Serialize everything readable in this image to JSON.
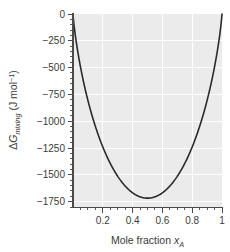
{
  "chart_data": {
    "type": "line",
    "title": "",
    "subtitle": "",
    "xlabel": "Mole fraction x_A",
    "xlabel_parts": {
      "text": "Mole fraction ",
      "symbol": "x",
      "subscript": "A"
    },
    "ylabel": "ΔG_mixing (J mol⁻¹)",
    "ylabel_parts": {
      "delta": "Δ",
      "symbol": "G",
      "subscript": "mixing",
      "units_open": " (J mol",
      "units_exp": "−1",
      "units_close": ")"
    },
    "xlim": [
      0,
      1
    ],
    "ylim": [
      -1800,
      0
    ],
    "xticks": [
      0.2,
      0.4,
      0.6,
      0.8,
      1
    ],
    "xtick_labels": [
      "0.2",
      "0.4",
      "0.6",
      "0.8",
      "1"
    ],
    "xminor_step": 0.05,
    "yticks": [
      0,
      -250,
      -500,
      -750,
      -1000,
      -1250,
      -1500,
      -1750
    ],
    "ytick_labels": [
      "0",
      "−250",
      "−500",
      "−750",
      "−1000",
      "−1250",
      "−1500",
      "−1750"
    ],
    "yminor_step": 50,
    "grid": true,
    "grid_color": "#ffffff",
    "panel_color": "#ebebeb",
    "legend": null,
    "series": [
      {
        "name": "Ideal Gibbs energy of mixing",
        "equation": "ΔG_mix = RT(x_A ln x_A + x_B ln x_B)",
        "RT": 2478,
        "color": "#2b2b2b",
        "x": [
          0.005,
          0.01,
          0.02,
          0.03,
          0.04,
          0.05,
          0.06,
          0.08,
          0.1,
          0.12,
          0.14,
          0.16,
          0.18,
          0.2,
          0.22,
          0.24,
          0.26,
          0.28,
          0.3,
          0.32,
          0.34,
          0.36,
          0.38,
          0.4,
          0.42,
          0.44,
          0.46,
          0.48,
          0.5,
          0.52,
          0.54,
          0.56,
          0.58,
          0.6,
          0.62,
          0.64,
          0.66,
          0.68,
          0.7,
          0.72,
          0.74,
          0.76,
          0.78,
          0.8,
          0.82,
          0.84,
          0.86,
          0.88,
          0.9,
          0.92,
          0.94,
          0.96,
          0.98,
          0.99,
          0.995
        ],
        "y": [
          -78,
          -135,
          -231,
          -315,
          -391,
          -462,
          -528,
          -652,
          -764,
          -867,
          -963,
          -1053,
          -1137,
          -1216,
          -1290,
          -1359,
          -1424,
          -1485,
          -1541,
          -1594,
          -1642,
          -1686,
          -1706,
          -1715,
          -1711,
          -1717,
          -1717,
          -1717,
          -1717,
          -1717,
          -1717,
          -1717,
          -1711,
          -1715,
          -1706,
          -1686,
          -1642,
          -1594,
          -1541,
          -1485,
          -1424,
          -1359,
          -1290,
          -1216,
          -1137,
          -1053,
          -963,
          -867,
          -764,
          -652,
          -528,
          -462,
          -231,
          -135,
          -78
        ],
        "minimum": {
          "x": 0.5,
          "y": -1717
        }
      }
    ]
  },
  "annotations": []
}
